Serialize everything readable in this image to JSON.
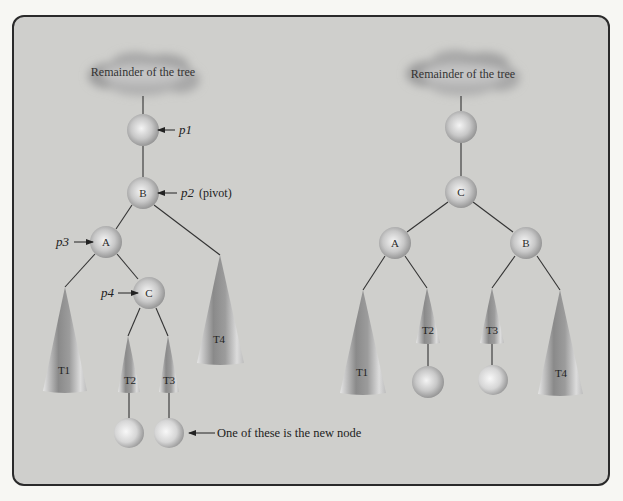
{
  "colors": {
    "background": "#cfcfcc",
    "frame_border": "#2a2a2a",
    "edge": "#333333",
    "node_light": "#f2f2f2",
    "node_dark": "#8a8a8a",
    "cone_light": "#e0e0e0",
    "cone_dark": "#7a7a7a"
  },
  "left_tree": {
    "cloud_label": "Remainder of the tree",
    "nodes": {
      "p1_node": {
        "label": ""
      },
      "B": {
        "label": "B"
      },
      "A": {
        "label": "A"
      },
      "C": {
        "label": "C"
      }
    },
    "pointers": {
      "p1": "p1",
      "p2": "p2",
      "p2_suffix": "(pivot)",
      "p3": "p3",
      "p4": "p4"
    },
    "subtrees": [
      "T1",
      "T2",
      "T3",
      "T4"
    ],
    "annotation": "One of these is the new node"
  },
  "right_tree": {
    "cloud_label": "Remainder of the tree",
    "nodes": {
      "top_node": {
        "label": ""
      },
      "C": {
        "label": "C"
      },
      "A": {
        "label": "A"
      },
      "B": {
        "label": "B"
      }
    },
    "subtrees": [
      "T1",
      "T2",
      "T3",
      "T4"
    ]
  }
}
